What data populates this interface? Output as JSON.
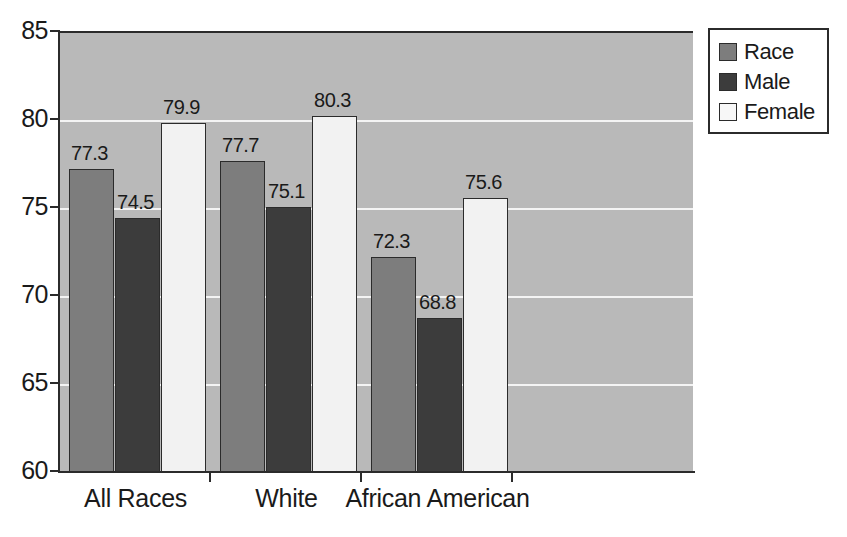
{
  "chart_data": {
    "type": "bar",
    "title": "",
    "subtitle": "",
    "xlabel": "",
    "ylabel": "",
    "categories": [
      "All Races",
      "White",
      "African American"
    ],
    "series": [
      {
        "name": "Race",
        "values": [
          77.3,
          77.7,
          72.3
        ],
        "color": "#7d7d7d"
      },
      {
        "name": "Male",
        "values": [
          74.5,
          75.1,
          68.8
        ],
        "color": "#3c3c3c"
      },
      {
        "name": "Female",
        "values": [
          79.9,
          80.3,
          75.6
        ],
        "color": "#f2f2f2"
      }
    ],
    "ylim": [
      60,
      85
    ],
    "yticks": [
      60,
      65,
      70,
      75,
      80,
      85
    ],
    "ytick_labels": [
      "60",
      "65",
      "70",
      "75",
      "80",
      "85"
    ],
    "grid": true,
    "gridline_values": [
      65,
      70,
      75,
      80
    ],
    "legend_position": "top-right",
    "plot_background": "#b9b9b9",
    "axis_color": "#2b2b2b",
    "data_labels": [
      [
        "77.3",
        "74.5",
        "79.9"
      ],
      [
        "77.7",
        "75.1",
        "80.3"
      ],
      [
        "72.3",
        "68.8",
        "75.6"
      ]
    ]
  },
  "legend": {
    "items": [
      {
        "label": "Race"
      },
      {
        "label": "Male"
      },
      {
        "label": "Female"
      }
    ]
  }
}
